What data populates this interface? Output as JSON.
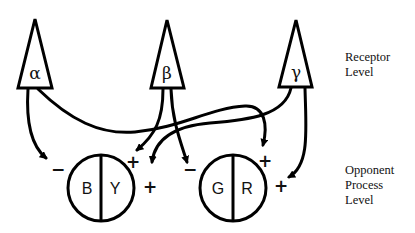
{
  "receptors": [
    {
      "id": "alpha",
      "symbol": "α"
    },
    {
      "id": "beta",
      "symbol": "β"
    },
    {
      "id": "gamma",
      "symbol": "γ"
    }
  ],
  "opponent_units": [
    {
      "id": "blue-yellow",
      "left": "B",
      "right": "Y"
    },
    {
      "id": "green-red",
      "left": "G",
      "right": "R"
    }
  ],
  "signs": {
    "by_minus": "−",
    "by_plus_top": "+",
    "by_plus_right": "+",
    "gr_minus": "−",
    "gr_plus_top": "+",
    "gr_plus_right": "+"
  },
  "levels": {
    "receptor": [
      "Receptor",
      "Level"
    ],
    "opponent": [
      "Opponent",
      "Process",
      "Level"
    ]
  },
  "connections": [
    {
      "from": "alpha",
      "to": "B",
      "sign": "−"
    },
    {
      "from": "alpha",
      "to": "R",
      "sign": "+"
    },
    {
      "from": "beta",
      "to": "Y",
      "sign": "+"
    },
    {
      "from": "beta",
      "to": "G",
      "sign": "−"
    },
    {
      "from": "gamma",
      "to": "Y",
      "sign": "+"
    },
    {
      "from": "gamma",
      "to": "R",
      "sign": "+"
    }
  ]
}
